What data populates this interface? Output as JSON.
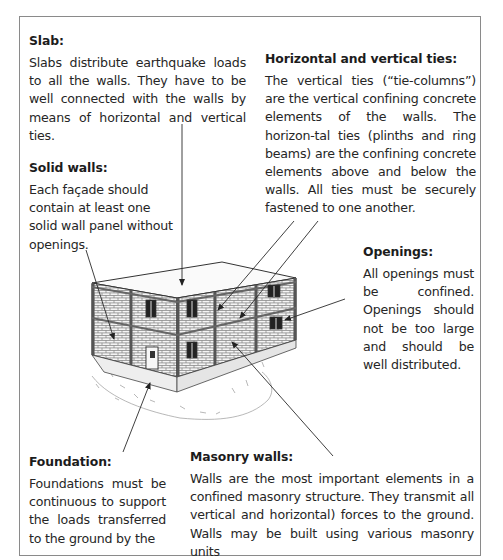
{
  "figure": {
    "labels": [
      {
        "id": "slab",
        "title": "Slab:",
        "text": "Slabs distribute earthquake loads to all the walls. They have to be well connected with the walls by means of horizontal and vertical ties."
      },
      {
        "id": "ties",
        "title": "Horizontal and vertical ties:",
        "text": "The vertical ties (“tie-columns”) are the vertical confining concrete elements of the walls. The horizon-tal ties (plinths and ring beams) are the confining concrete elements above and below the walls. All ties must be securely fastened to one another."
      },
      {
        "id": "solid_walls",
        "title": "Solid walls:",
        "text": "Each façade should contain at least one solid wall panel without openings."
      },
      {
        "id": "openings",
        "title": "Openings:",
        "text": "All openings must be confined. Openings should not be too large and should be well distributed."
      },
      {
        "id": "foundation",
        "title": "Foundation:",
        "text": "Foundations must be continuous to support the loads transferred to the ground by the"
      },
      {
        "id": "masonry_walls",
        "title": "Masonry walls:",
        "text": "Walls are the most important elements in a confined masonry structure. They transmit all vertical and horizontal) forces to the ground. Walls may be built using various masonry units"
      }
    ],
    "illustration": "Two-storey confined masonry building with brick walls, concrete tie-columns and ring beams, windows, a door, flat roof slab and foundation on the ground",
    "colors": {
      "frame": "#8a8a8a",
      "text": "#262626",
      "line": "#2a2a2a"
    }
  }
}
